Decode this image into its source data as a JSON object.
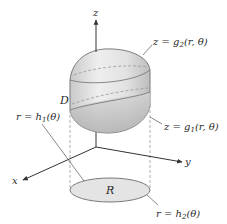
{
  "diagram": {
    "type": "3d-region-cylindrical-coordinates",
    "axes": {
      "z": {
        "label": "z"
      },
      "x": {
        "label": "x"
      },
      "y": {
        "label": "y"
      }
    },
    "solid": {
      "label": "D",
      "top_surface_label": "z = g",
      "top_surface_sub": "2",
      "top_surface_args": "(r, θ)",
      "bottom_surface_label": "z = g",
      "bottom_surface_sub": "1",
      "bottom_surface_args": "(r, θ)"
    },
    "region": {
      "label": "R",
      "inner_boundary_label": "r = h",
      "inner_boundary_sub": "1",
      "inner_boundary_args": "(θ)",
      "outer_boundary_label": "r = h",
      "outer_boundary_sub": "2",
      "outer_boundary_args": "(θ)"
    },
    "colors": {
      "axis": "#333333",
      "solid_fill_light": "#e6e6e6",
      "solid_fill_dark": "#b5b5b5",
      "region_fill": "#e4e4e4",
      "outline": "#7a7a7a",
      "dashed": "#9a9a9a"
    }
  }
}
